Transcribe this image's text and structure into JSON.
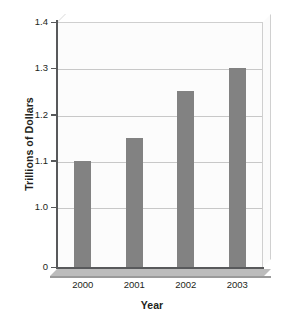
{
  "chart_data": {
    "type": "bar",
    "title": "",
    "xlabel": "Year",
    "ylabel": "Trillions of Dollars",
    "categories": [
      "2000",
      "2001",
      "2002",
      "2003"
    ],
    "values": [
      1.1,
      1.15,
      1.25,
      1.3
    ],
    "series": [
      {
        "name": "Trillions of Dollars",
        "values": [
          1.1,
          1.15,
          1.25,
          1.3
        ]
      }
    ],
    "ylim": [
      1.0,
      1.4
    ],
    "y_ticks": [
      "1.4",
      "1.3",
      "1.2",
      "1.1",
      "1.0",
      "0"
    ],
    "y_tick_values": [
      1.4,
      1.3,
      1.2,
      1.1,
      1.0,
      0
    ],
    "axis_broken": true,
    "grid": true,
    "legend": false,
    "bar_color": "#828282",
    "plot_background": "#fcfcfc",
    "gridline_color": "#c8c8c8",
    "axis_color": "#58595b",
    "text_color": "#231f20"
  }
}
